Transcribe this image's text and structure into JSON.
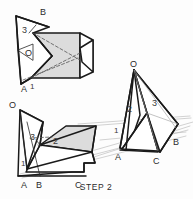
{
  "figure": {
    "caption": "STEP 2",
    "type": "technical-line-drawing",
    "background_color": "#fdfdfd",
    "line_color": "#1a1a1a",
    "fill_color": "#dcdcdc",
    "projection_line_color": "#b4b4b4",
    "fold_line_color": "#555555",
    "views": [
      {
        "id": "top-left",
        "name": "partially-folded-net-view",
        "labels": [
          {
            "text": "B",
            "x": 40,
            "y": 15
          },
          {
            "text": "3",
            "x": 24,
            "y": 31
          },
          {
            "text": "O",
            "x": 27,
            "y": 54
          },
          {
            "text": "A",
            "x": 23,
            "y": 88
          },
          {
            "text": "1",
            "x": 31,
            "y": 86
          }
        ]
      },
      {
        "id": "bottom-left",
        "name": "flattened-net-view",
        "labels": [
          {
            "text": "O",
            "x": 11,
            "y": 106
          },
          {
            "text": "3",
            "x": 32,
            "y": 138
          },
          {
            "text": "2",
            "x": 55,
            "y": 141
          },
          {
            "text": "1",
            "x": 22,
            "y": 164
          },
          {
            "text": "A",
            "x": 24,
            "y": 188
          },
          {
            "text": "B",
            "x": 39,
            "y": 188
          },
          {
            "text": "C",
            "x": 77,
            "y": 188
          }
        ]
      },
      {
        "id": "right",
        "name": "folded-tetrahedron-view",
        "labels": [
          {
            "text": "O",
            "x": 131,
            "y": 67
          },
          {
            "text": "2",
            "x": 129,
            "y": 110
          },
          {
            "text": "3",
            "x": 154,
            "y": 104
          },
          {
            "text": "1",
            "x": 115,
            "y": 131
          },
          {
            "text": "A",
            "x": 117,
            "y": 156
          },
          {
            "text": "C",
            "x": 155,
            "y": 160
          },
          {
            "text": "B",
            "x": 175,
            "y": 142
          }
        ]
      }
    ]
  }
}
